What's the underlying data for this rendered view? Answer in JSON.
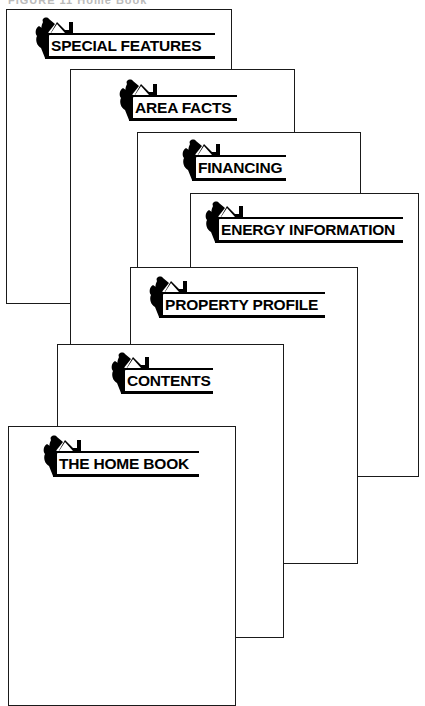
{
  "caption": "FIGURE 11 Home Book",
  "pages": [
    {
      "id": "special-features",
      "label": "SPECIAL FEATURES"
    },
    {
      "id": "area-facts",
      "label": "AREA FACTS"
    },
    {
      "id": "financing",
      "label": "FINANCING"
    },
    {
      "id": "energy-information",
      "label": "ENERGY INFORMATION"
    },
    {
      "id": "property-profile",
      "label": "PROPERTY PROFILE"
    },
    {
      "id": "contents",
      "label": "CONTENTS"
    },
    {
      "id": "the-home-book",
      "label": "THE HOME BOOK"
    }
  ],
  "logo_icon": "house-with-tree-icon",
  "colors": {
    "ink": "#000000",
    "paper": "#ffffff"
  }
}
